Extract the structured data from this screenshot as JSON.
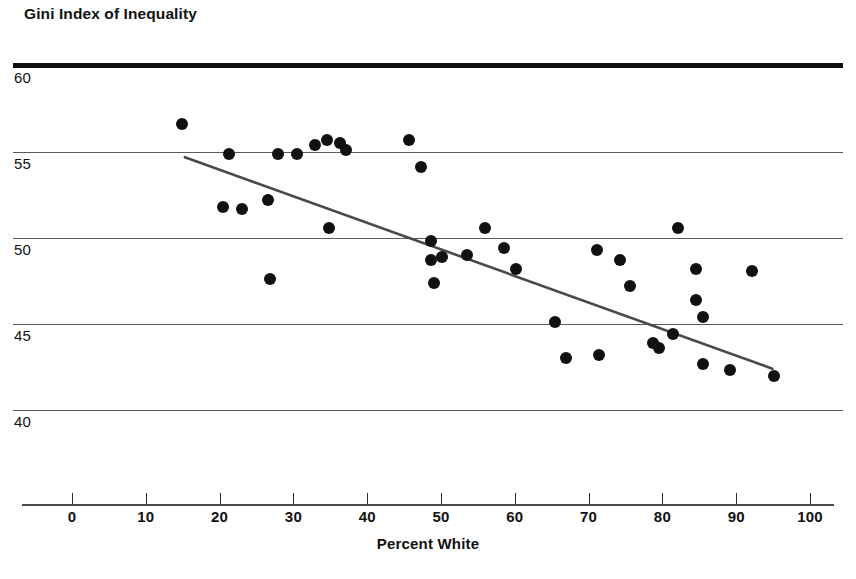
{
  "chart_data": {
    "type": "scatter",
    "title": "Gini Index of Inequality",
    "xlabel": "Percent White",
    "ylabel": "Gini Index of Inequality",
    "xlim": [
      0,
      100
    ],
    "ylim": [
      38,
      60
    ],
    "xticks": [
      0,
      10,
      20,
      30,
      40,
      50,
      60,
      70,
      80,
      90,
      100
    ],
    "yticks": [
      40,
      45,
      50,
      55,
      60
    ],
    "grid": "horizontal",
    "legend": "none",
    "series": [
      {
        "name": "States",
        "marker": "filled-circle",
        "color": "#111111",
        "points": [
          {
            "x": 14.9,
            "y": 56.6
          },
          {
            "x": 21.3,
            "y": 54.9
          },
          {
            "x": 20.5,
            "y": 51.8
          },
          {
            "x": 23.0,
            "y": 51.7
          },
          {
            "x": 26.5,
            "y": 52.2
          },
          {
            "x": 26.8,
            "y": 47.6
          },
          {
            "x": 27.9,
            "y": 54.9
          },
          {
            "x": 30.5,
            "y": 54.9
          },
          {
            "x": 32.9,
            "y": 55.4
          },
          {
            "x": 34.5,
            "y": 55.7
          },
          {
            "x": 36.3,
            "y": 55.5
          },
          {
            "x": 37.1,
            "y": 55.1
          },
          {
            "x": 34.8,
            "y": 50.6
          },
          {
            "x": 45.7,
            "y": 55.7
          },
          {
            "x": 47.3,
            "y": 54.1
          },
          {
            "x": 48.6,
            "y": 49.8
          },
          {
            "x": 48.6,
            "y": 48.7
          },
          {
            "x": 49.0,
            "y": 47.4
          },
          {
            "x": 50.1,
            "y": 48.9
          },
          {
            "x": 53.5,
            "y": 49.0
          },
          {
            "x": 56.0,
            "y": 50.6
          },
          {
            "x": 58.5,
            "y": 49.4
          },
          {
            "x": 60.1,
            "y": 48.2
          },
          {
            "x": 65.4,
            "y": 45.1
          },
          {
            "x": 67.0,
            "y": 43.0
          },
          {
            "x": 71.2,
            "y": 49.3
          },
          {
            "x": 71.4,
            "y": 43.2
          },
          {
            "x": 74.2,
            "y": 48.7
          },
          {
            "x": 75.6,
            "y": 47.2
          },
          {
            "x": 78.7,
            "y": 43.9
          },
          {
            "x": 79.6,
            "y": 43.6
          },
          {
            "x": 81.5,
            "y": 44.4
          },
          {
            "x": 82.1,
            "y": 50.6
          },
          {
            "x": 84.6,
            "y": 48.2
          },
          {
            "x": 84.6,
            "y": 46.4
          },
          {
            "x": 85.5,
            "y": 45.4
          },
          {
            "x": 85.5,
            "y": 42.7
          },
          {
            "x": 89.2,
            "y": 42.3
          },
          {
            "x": 92.2,
            "y": 48.1
          },
          {
            "x": 95.1,
            "y": 42.0
          }
        ]
      }
    ],
    "trendline": {
      "name": "least-squares-fit",
      "color": "#4a4a4a",
      "x_start": 15.3,
      "y_start": 54.7,
      "x_end": 94.9,
      "y_end": 42.4
    }
  }
}
